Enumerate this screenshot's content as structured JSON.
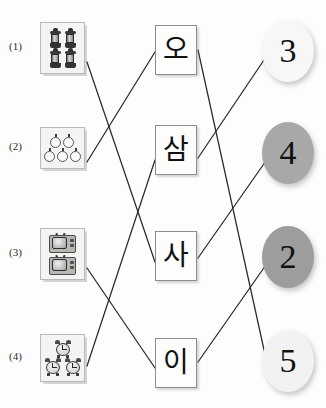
{
  "worksheet": {
    "title": "Korean number matching worksheet",
    "background_color": "#fdfdfd",
    "line_color": "#2a2a2a"
  },
  "left_column": {
    "items": [
      {
        "label": "(1)",
        "icon": "lantern-icon",
        "count": 4,
        "count_text": "4",
        "layout": "2x2",
        "x": 40,
        "y": 22,
        "w": 45,
        "h": 52
      },
      {
        "label": "(2)",
        "icon": "balloon-icon",
        "count": 5,
        "count_text": "5",
        "layout": "2-over-3",
        "x": 40,
        "y": 127,
        "w": 45,
        "h": 42
      },
      {
        "label": "(3)",
        "icon": "television-icon",
        "count": 2,
        "count_text": "2",
        "layout": "1-over-1",
        "x": 40,
        "y": 228,
        "w": 45,
        "h": 52
      },
      {
        "label": "(4)",
        "icon": "alarm-clock-icon",
        "count": 3,
        "count_text": "3",
        "layout": "1-over-2",
        "x": 40,
        "y": 334,
        "w": 45,
        "h": 48
      }
    ]
  },
  "middle_column": {
    "cards": [
      {
        "text": "오",
        "romanization": "o",
        "value": 5,
        "x": 155,
        "y": 25,
        "w": 42,
        "h": 50
      },
      {
        "text": "삼",
        "romanization": "sam",
        "value": 3,
        "x": 155,
        "y": 125,
        "w": 42,
        "h": 50
      },
      {
        "text": "사",
        "romanization": "sa",
        "value": 4,
        "x": 155,
        "y": 231,
        "w": 42,
        "h": 50
      },
      {
        "text": "이",
        "romanization": "i",
        "value": 2,
        "x": 155,
        "y": 338,
        "w": 42,
        "h": 50
      }
    ]
  },
  "right_column": {
    "ovals": [
      {
        "text": "3",
        "fill": "#f7f7f7",
        "x": 262,
        "y": 20,
        "w": 52,
        "h": 62
      },
      {
        "text": "4",
        "fill": "#a8a8a8",
        "x": 262,
        "y": 122,
        "w": 52,
        "h": 62
      },
      {
        "text": "2",
        "fill": "#9d9d9d",
        "x": 262,
        "y": 226,
        "w": 52,
        "h": 62
      },
      {
        "text": "5",
        "fill": "#f2f2f2",
        "x": 262,
        "y": 330,
        "w": 52,
        "h": 62
      }
    ]
  },
  "connections": {
    "picture_to_syllable": [
      {
        "from": "(1)",
        "to": "사",
        "x1": 87,
        "y1": 62,
        "x2": 155,
        "y2": 262
      },
      {
        "from": "(2)",
        "to": "오",
        "x1": 87,
        "y1": 162,
        "x2": 155,
        "y2": 52
      },
      {
        "from": "(3)",
        "to": "이",
        "x1": 87,
        "y1": 268,
        "x2": 155,
        "y2": 368
      },
      {
        "from": "(4)",
        "to": "삼",
        "x1": 87,
        "y1": 366,
        "x2": 155,
        "y2": 160
      }
    ],
    "syllable_to_number": [
      {
        "from": "오",
        "to": "5",
        "x1": 198,
        "y1": 50,
        "x2": 268,
        "y2": 368
      },
      {
        "from": "삼",
        "to": "3",
        "x1": 198,
        "y1": 158,
        "x2": 268,
        "y2": 54
      },
      {
        "from": "사",
        "to": "4",
        "x1": 198,
        "y1": 258,
        "x2": 268,
        "y2": 158
      },
      {
        "from": "이",
        "to": "2",
        "x1": 198,
        "y1": 362,
        "x2": 268,
        "y2": 262
      }
    ]
  }
}
